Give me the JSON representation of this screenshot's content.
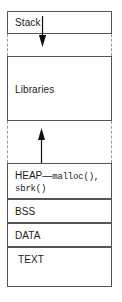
{
  "diagram": {
    "colors": {
      "box_border": "#555555",
      "gap_border": "#9a9a9a",
      "text": "#1a1a1a",
      "arrow": "#111111",
      "background": "#ffffff"
    },
    "segments": [
      {
        "id": "stack",
        "label": "Stack"
      },
      {
        "id": "libraries",
        "label": "Libraries"
      },
      {
        "id": "heap",
        "label": "HEAP",
        "separator": "—",
        "line1_code": "malloc(),",
        "line2_code": "sbrk()"
      },
      {
        "id": "bss",
        "label": "BSS"
      },
      {
        "id": "data",
        "label": "DATA"
      },
      {
        "id": "text",
        "label": "TEXT"
      }
    ],
    "arrows": [
      {
        "id": "stack-grow-down",
        "direction": "down",
        "from": "stack",
        "toward": "libraries"
      },
      {
        "id": "heap-grow-up",
        "direction": "up",
        "from": "heap",
        "toward": "libraries"
      }
    ]
  }
}
